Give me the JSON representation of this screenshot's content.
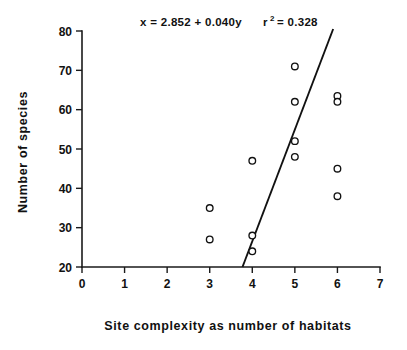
{
  "chart_data": {
    "type": "scatter",
    "title": "",
    "xlabel": "Site complexity as number of habitats",
    "ylabel": "Number of species",
    "xlim": [
      0,
      7
    ],
    "ylim": [
      20,
      80
    ],
    "xticks": [
      0,
      1,
      2,
      3,
      4,
      5,
      6,
      7
    ],
    "xtick_labels": [
      "0",
      "1",
      "2",
      "3",
      "4",
      "5",
      "6",
      "7"
    ],
    "yticks": [
      20,
      30,
      40,
      50,
      60,
      70,
      80
    ],
    "ytick_labels": [
      "20",
      "30",
      "40",
      "50",
      "60",
      "70",
      "80"
    ],
    "grid": false,
    "legend": "none",
    "points": [
      {
        "x": 3,
        "y": 35
      },
      {
        "x": 3,
        "y": 27
      },
      {
        "x": 4,
        "y": 47
      },
      {
        "x": 4,
        "y": 28
      },
      {
        "x": 4,
        "y": 24
      },
      {
        "x": 5,
        "y": 71
      },
      {
        "x": 5,
        "y": 62
      },
      {
        "x": 5,
        "y": 52
      },
      {
        "x": 5,
        "y": 48
      },
      {
        "x": 6,
        "y": 63.5
      },
      {
        "x": 6,
        "y": 62
      },
      {
        "x": 6,
        "y": 45
      },
      {
        "x": 6,
        "y": 38
      }
    ],
    "fit_line": {
      "label": "regression-line",
      "x_start": 3.77,
      "y_start": 20,
      "x_end": 5.9,
      "y_end": 80.5
    },
    "annotations": {
      "equation": "x  =  2.852  +  0.040y",
      "r_symbol": "r",
      "r_exponent": "2",
      "r_equals": "=  0.328"
    }
  },
  "marker_color": "#111111",
  "line_color": "#111111",
  "axis_color": "#1a1a1a",
  "background_color": "#ffffff"
}
